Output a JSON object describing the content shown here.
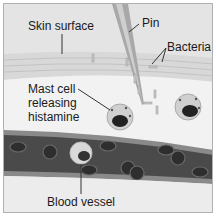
{
  "figure": {
    "labels": {
      "skin_surface": "Skin surface",
      "pin": "Pin",
      "bacteria": "Bacteria",
      "mast_cell_line1": "Mast cell",
      "mast_cell_line2": "releasing",
      "mast_cell_line3": "histamine",
      "blood_vessel": "Blood vessel"
    },
    "colors": {
      "background": "#e6e6e6",
      "dermis": "#f2f2f2",
      "vessel_interior": "#4a4a4a",
      "red_cell": "#3a3a3a",
      "wall": "#9a9a9a"
    }
  }
}
